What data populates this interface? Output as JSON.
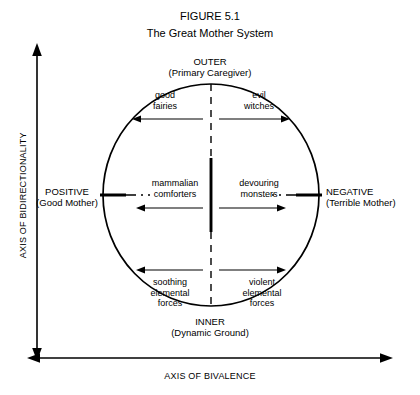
{
  "figure": {
    "number": "FIGURE 5.1",
    "title": "The Great Mother System"
  },
  "poles": {
    "top": "OUTER\n(Primary Caregiver)",
    "bottom": "INNER\n(Dynamic Ground)",
    "left": "POSITIVE\n(Good Mother)",
    "right": "NEGATIVE\n(Terrible Mother)"
  },
  "axes": {
    "vertical_label": "AXIS OF BIDIRECTIONALITY",
    "horizontal_label": "AXIS OF BIVALENCE"
  },
  "quadrants": {
    "top_left": "good\nfairies",
    "top_right": "evil\nwitches",
    "middle_left": "mammalian\ncomforters",
    "middle_right": "devouring\nmonsters",
    "bottom_left": "soothing\nelemental\nforces",
    "bottom_right": "violent\nelemental\nforces"
  },
  "colors": {
    "ink": "#000000",
    "background": "#ffffff"
  }
}
